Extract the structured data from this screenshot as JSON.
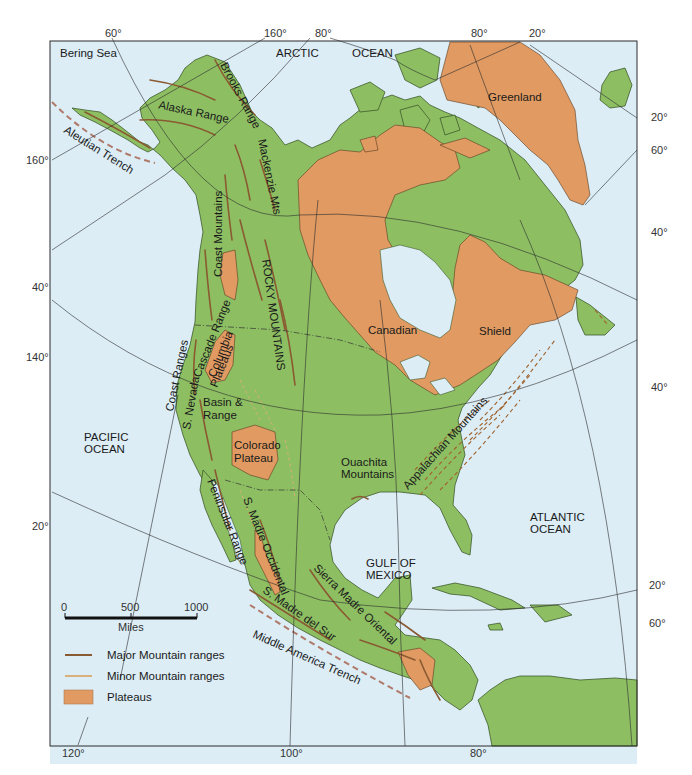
{
  "colors": {
    "ocean": "#dcedf6",
    "land": "#8dbf62",
    "land_edge": "#3d5a2c",
    "plateau": "#e09a62",
    "major_range": "#8a5a32",
    "minor_range": "#d9b07a",
    "trench": "#b07a6a",
    "grid": "#2b2b2b",
    "frame": "#2b2b2b"
  },
  "map": {
    "title": "Physiographic map of North America",
    "water_labels": {
      "bering_sea": "Bering Sea",
      "arctic": "ARCTIC",
      "ocean_arctic": "OCEAN",
      "pacific_1": "PACIFIC",
      "pacific_2": "OCEAN",
      "atlantic_1": "ATLANTIC",
      "atlantic_2": "OCEAN",
      "gulf_1": "GULF OF",
      "gulf_2": "MEXICO"
    },
    "region_labels": {
      "greenland": "Greenland",
      "canadian": "Canadian",
      "shield": "Shield",
      "alaska_range": "Alaska Range",
      "brooks_range": "Brooks Range",
      "mackenzie": "Mackenzie Mts",
      "coast_mountains": "Coast Mountains",
      "rocky_mountains": "ROCKY MOUNTAINS",
      "cascade": "Cascade Range",
      "columbia_1": "Columbia",
      "columbia_2": "Plateaus",
      "coast_ranges": "Coast Ranges",
      "s_nevada": "S. Nevada",
      "basin_1": "Basin &",
      "basin_2": "Range",
      "colorado_1": "Colorado",
      "colorado_2": "Plateau",
      "ouachita_1": "Ouachita",
      "ouachita_2": "Mountains",
      "appalachian": "Appalachian Mountains",
      "peninsular": "Peninsular Range",
      "madre_occidental": "S. Madre Occidental",
      "madre_oriental": "Sierra Madre Oriental",
      "madre_sur": "S. Madre del Sur",
      "aleutian": "Aleutian Trench",
      "middle_america": "Middle America Trench"
    },
    "graticule_labels": {
      "top": [
        "60°",
        "160°",
        "80°",
        "80°",
        "20°"
      ],
      "left": [
        "160°",
        "40°",
        "140°",
        "20°"
      ],
      "right": [
        "20°",
        "60°",
        "40°",
        "40°",
        "20°",
        "60°"
      ],
      "bottom": [
        "120°",
        "100°",
        "80°"
      ]
    }
  },
  "scale_bar": {
    "ticks": [
      "0",
      "500",
      "1000"
    ],
    "unit": "Miles"
  },
  "legend": {
    "items": [
      {
        "label": "Major Mountain ranges",
        "type": "major"
      },
      {
        "label": "Minor Mountain ranges",
        "type": "minor"
      },
      {
        "label": "Plateaus",
        "type": "plateau"
      }
    ]
  },
  "caption": "Figure 11.1"
}
